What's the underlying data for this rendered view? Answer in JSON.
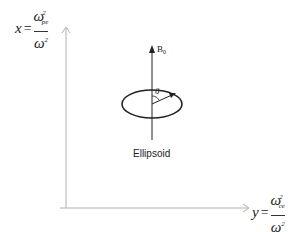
{
  "diagram": {
    "x_axis_label": {
      "variable": "x",
      "equals": "=",
      "numerator_base": "ω",
      "numerator_sub": "pe",
      "numerator_sup": "2",
      "denominator_base": "ω",
      "denominator_sup": "2"
    },
    "y_axis_label": {
      "variable": "y",
      "equals": "=",
      "numerator_base": "ω",
      "numerator_sub": "ce",
      "numerator_sup": "2",
      "denominator_base": "ω",
      "denominator_sup": "2"
    },
    "field_label": "B",
    "field_label_sub": "0",
    "angle_label": "θ",
    "shape_caption": "Ellipsoid",
    "colors": {
      "axis": "#b0b0b0",
      "ink": "#222222"
    }
  }
}
